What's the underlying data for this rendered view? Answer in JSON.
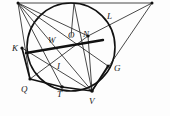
{
  "figure": {
    "background_color": "#fdfdfd",
    "stroke_color": "#111111",
    "labels": [
      {
        "text": "W",
        "x": 48,
        "y": 36,
        "name": "point-label-w"
      },
      {
        "text": "O",
        "x": 68,
        "y": 31,
        "name": "point-label-o"
      },
      {
        "text": "N",
        "x": 83,
        "y": 30,
        "name": "point-label-n"
      },
      {
        "text": "L",
        "x": 107,
        "y": 12,
        "name": "point-label-l"
      },
      {
        "text": "K",
        "x": 12,
        "y": 44,
        "name": "point-label-k"
      },
      {
        "text": "G",
        "x": 114,
        "y": 64,
        "name": "point-label-g"
      },
      {
        "text": "I",
        "x": 57,
        "y": 62,
        "name": "point-label-i"
      },
      {
        "text": "Q",
        "x": 21,
        "y": 85,
        "name": "point-label-q"
      },
      {
        "text": "T",
        "x": 57,
        "y": 90,
        "name": "point-label-t"
      },
      {
        "text": "V",
        "x": 89,
        "y": 97,
        "name": "point-label-v"
      }
    ],
    "circle": {
      "cx": 71,
      "cy": 47,
      "r": 44,
      "name": "main-circle"
    },
    "points": {
      "A": {
        "x": 18,
        "y": 3,
        "name": "apex-left"
      },
      "B": {
        "x": 152,
        "y": 3,
        "name": "apex-right"
      },
      "Ctop": {
        "x": 74,
        "y": 3,
        "name": "apex-top-mid"
      },
      "W": {
        "x": 53,
        "y": 41,
        "name": "point-w"
      },
      "O": {
        "x": 71,
        "y": 37,
        "name": "point-o-center"
      },
      "N": {
        "x": 88,
        "y": 36,
        "name": "point-n"
      },
      "K": {
        "x": 22,
        "y": 48,
        "name": "point-k"
      },
      "G": {
        "x": 108,
        "y": 66,
        "name": "point-g"
      },
      "I": {
        "x": 60,
        "y": 57,
        "name": "point-i"
      },
      "Q": {
        "x": 30,
        "y": 79,
        "name": "point-q"
      },
      "T": {
        "x": 62,
        "y": 87,
        "name": "point-t"
      },
      "V": {
        "x": 92,
        "y": 91,
        "name": "point-v"
      },
      "L": {
        "x": 103,
        "y": 17,
        "name": "point-l"
      }
    },
    "segments": [
      {
        "from": "A",
        "to": "B",
        "name": "segment-top-base"
      },
      {
        "from": "A",
        "to": "Q",
        "name": "segment-a-q"
      },
      {
        "from": "A",
        "to": "T",
        "name": "segment-a-t"
      },
      {
        "from": "A",
        "to": "V",
        "name": "segment-a-v"
      },
      {
        "from": "A",
        "to": "N",
        "name": "segment-a-n"
      },
      {
        "from": "A",
        "to": "G",
        "name": "segment-a-g"
      },
      {
        "from": "B",
        "to": "V",
        "name": "segment-b-v"
      },
      {
        "from": "B",
        "to": "N",
        "name": "segment-b-n"
      },
      {
        "from": "Ctop",
        "to": "V",
        "name": "segment-ctop-v"
      },
      {
        "from": "Q",
        "to": "N",
        "name": "segment-q-n"
      },
      {
        "from": "Q",
        "to": "V",
        "name": "segment-q-v"
      },
      {
        "from": "K",
        "to": "V",
        "name": "segment-k-v"
      },
      {
        "from": "N",
        "to": "V",
        "name": "segment-n-v"
      },
      {
        "from": "T",
        "to": "V",
        "name": "segment-t-v"
      }
    ],
    "chord": {
      "from": {
        "x": 26,
        "y": 53
      },
      "to": {
        "x": 103,
        "y": 40
      },
      "name": "bold-chord-kn"
    }
  }
}
